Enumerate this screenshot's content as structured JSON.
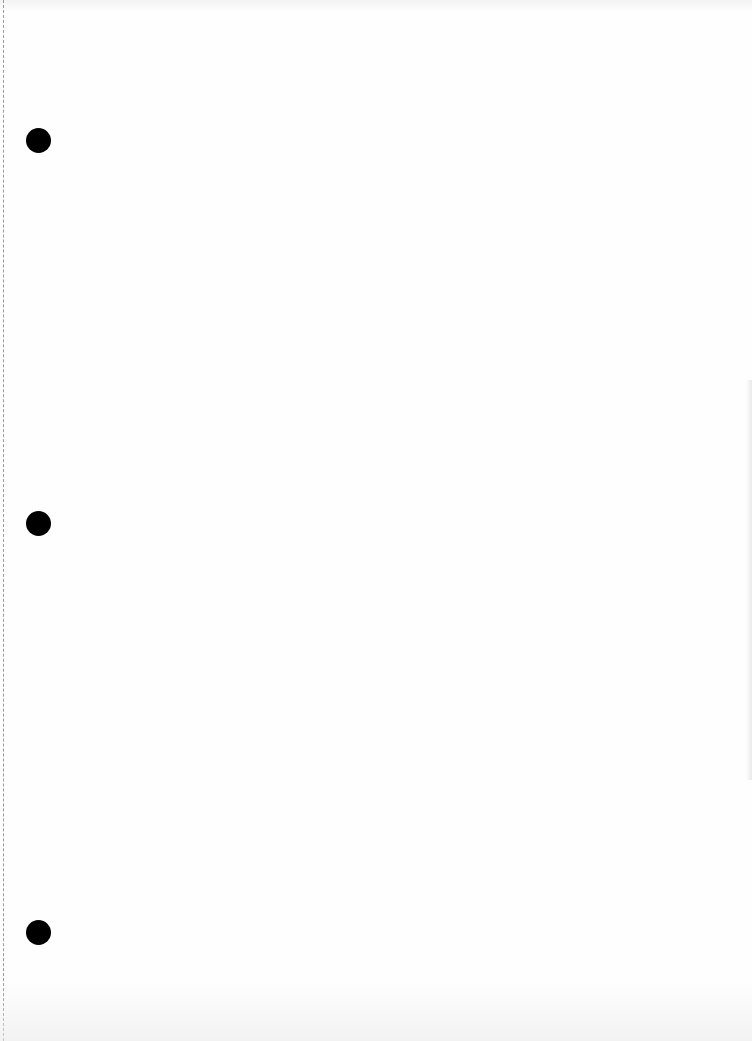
{
  "document": {
    "type": "blank scanned page",
    "text": "",
    "punch_holes": [
      {
        "cx": 38,
        "cy": 140
      },
      {
        "cx": 38,
        "cy": 523
      },
      {
        "cx": 38,
        "cy": 932
      }
    ],
    "colors": {
      "paper": "#fefefe",
      "hole": "#000000",
      "edge_line": "#9a9a9a"
    }
  }
}
